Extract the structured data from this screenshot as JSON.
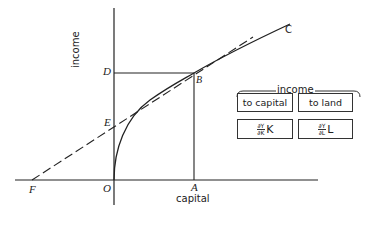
{
  "diagram": {
    "axes": {
      "y_label": "income",
      "x_label": "capital"
    },
    "points": {
      "D": "D",
      "B": "B",
      "C": "C",
      "E": "E",
      "F": "F",
      "O": "O",
      "A": "A"
    },
    "legend": {
      "title": "income",
      "to_capital": "to capital",
      "to_land": "to land",
      "capital_formula": {
        "num": "∂Y",
        "den": "∂K",
        "var": "K"
      },
      "land_formula": {
        "num": "∂Y",
        "den": "∂L",
        "var": "L"
      }
    },
    "colors": {
      "line": "#222222",
      "background": "#ffffff"
    }
  }
}
